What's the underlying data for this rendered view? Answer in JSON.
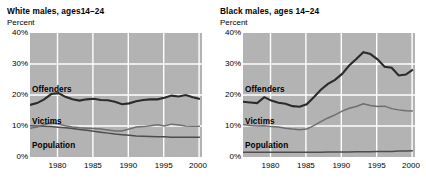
{
  "chart_data": [
    {
      "type": "line",
      "panel_id": "white-males",
      "title": "White males, ages14–24",
      "ylabel": "Percent",
      "xlabel": "",
      "ylim": [
        0,
        40
      ],
      "xlim": [
        1976,
        2000
      ],
      "yticks": [
        "0%",
        "10%",
        "20%",
        "30%",
        "40%"
      ],
      "ytick_values": [
        0,
        10,
        20,
        30,
        40
      ],
      "xticks": [
        "1980",
        "1985",
        "1990",
        "1995",
        "2000"
      ],
      "xtick_values": [
        1980,
        1985,
        1990,
        1995,
        2000
      ],
      "grid": true,
      "legend": "inline-labels",
      "x": [
        1976,
        1977,
        1978,
        1979,
        1980,
        1981,
        1982,
        1983,
        1984,
        1985,
        1986,
        1987,
        1988,
        1989,
        1990,
        1991,
        1992,
        1993,
        1994,
        1995,
        1996,
        1997,
        1998,
        1999,
        2000
      ],
      "series": [
        {
          "name": "Offenders",
          "color": "#2b2b2b",
          "values": [
            16.8,
            17.4,
            18.6,
            20.3,
            20.6,
            19.4,
            18.6,
            18.2,
            18.6,
            18.8,
            18.4,
            18.3,
            17.8,
            17.0,
            17.3,
            18.0,
            18.4,
            18.6,
            18.6,
            19.1,
            19.8,
            19.5,
            20.0,
            19.3,
            18.7
          ]
        },
        {
          "name": "Victims",
          "color": "#6e6e6e",
          "values": [
            9.3,
            9.7,
            10.4,
            11.1,
            10.6,
            10.1,
            9.7,
            9.4,
            9.3,
            9.2,
            9.0,
            8.7,
            8.4,
            8.4,
            9.0,
            9.7,
            9.8,
            10.1,
            10.4,
            10.0,
            10.6,
            10.3,
            10.0,
            9.9,
            9.9
          ]
        },
        {
          "name": "Population",
          "color": "#4d4d4d",
          "values": [
            10.1,
            10.0,
            9.9,
            9.8,
            9.6,
            9.4,
            9.2,
            8.9,
            8.6,
            8.3,
            8.0,
            7.7,
            7.4,
            7.2,
            7.0,
            6.8,
            6.7,
            6.6,
            6.5,
            6.5,
            6.4,
            6.4,
            6.4,
            6.4,
            6.4
          ]
        }
      ]
    },
    {
      "type": "line",
      "panel_id": "black-males",
      "title": "Black males, ages 14–24",
      "ylabel": "Percent",
      "xlabel": "",
      "ylim": [
        0,
        40
      ],
      "xlim": [
        1976,
        2000
      ],
      "yticks": [
        "0%",
        "10%",
        "20%",
        "30%",
        "40%"
      ],
      "ytick_values": [
        0,
        10,
        20,
        30,
        40
      ],
      "xticks": [
        "1980",
        "1985",
        "1990",
        "1995",
        "2000"
      ],
      "xtick_values": [
        1980,
        1985,
        1990,
        1995,
        2000
      ],
      "grid": true,
      "legend": "inline-labels",
      "x": [
        1976,
        1977,
        1978,
        1979,
        1980,
        1981,
        1982,
        1983,
        1984,
        1985,
        1986,
        1987,
        1988,
        1989,
        1990,
        1991,
        1992,
        1993,
        1994,
        1995,
        1996,
        1997,
        1998,
        1999,
        2000
      ],
      "series": [
        {
          "name": "Offenders",
          "color": "#2b2b2b",
          "values": [
            17.8,
            17.6,
            17.4,
            19.3,
            18.2,
            17.5,
            17.2,
            16.4,
            16.2,
            17.0,
            19.3,
            21.7,
            23.6,
            24.9,
            26.8,
            29.5,
            31.6,
            33.8,
            33.2,
            31.5,
            29.1,
            28.8,
            26.3,
            26.6,
            28.2
          ]
        },
        {
          "name": "Victims",
          "color": "#6e6e6e",
          "values": [
            10.5,
            10.2,
            10.0,
            10.1,
            9.8,
            9.7,
            9.3,
            9.0,
            8.8,
            9.0,
            10.1,
            11.4,
            12.6,
            13.6,
            14.8,
            15.7,
            16.3,
            17.2,
            16.6,
            16.3,
            16.4,
            15.6,
            15.2,
            14.9,
            14.8
          ]
        },
        {
          "name": "Population",
          "color": "#4d4d4d",
          "values": [
            1.5,
            1.5,
            1.5,
            1.5,
            1.5,
            1.5,
            1.5,
            1.5,
            1.5,
            1.5,
            1.5,
            1.5,
            1.6,
            1.6,
            1.6,
            1.6,
            1.7,
            1.7,
            1.7,
            1.8,
            1.8,
            1.8,
            1.9,
            1.9,
            2.0
          ]
        }
      ]
    }
  ],
  "panels": {
    "left": {
      "title": "White males, ages14–24",
      "unit": "Percent",
      "yticks": [
        "40%",
        "30%",
        "20%",
        "10%",
        "0%"
      ],
      "xticks": [
        "1980",
        "1985",
        "1990",
        "1995",
        "2000"
      ],
      "labels": {
        "offenders": "Offenders",
        "victims": "Victims",
        "population": "Population"
      }
    },
    "right": {
      "title": "Black males, ages 14–24",
      "unit": "Percent",
      "yticks": [
        "40%",
        "30%",
        "20%",
        "10%",
        "0%"
      ],
      "xticks": [
        "1980",
        "1985",
        "1990",
        "1995",
        "2000"
      ],
      "labels": {
        "offenders": "Offenders",
        "victims": "Victims",
        "population": "Population"
      }
    }
  },
  "style": {
    "plot_background": "#b3b3b3",
    "grid_color": "#ffffff",
    "axis_color": "#000000",
    "offender_color": "#2b2b2b",
    "victim_color": "#6e6e6e",
    "population_color": "#4d4d4d"
  }
}
